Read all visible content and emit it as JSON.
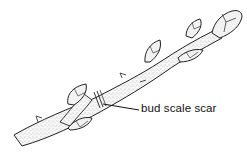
{
  "diagram": {
    "style": "stippled line drawing",
    "colors": {
      "background": "#ffffff",
      "stroke": "#222222",
      "fill": "#f4f4f4",
      "stipple": "#888888"
    },
    "labels": [
      {
        "id": "bud-scale-scar",
        "text": "bud scale scar",
        "x": 141,
        "y": 102
      }
    ],
    "parts": [
      "stem",
      "terminal bud",
      "lateral buds",
      "bud scale scar",
      "leaf scars"
    ]
  }
}
